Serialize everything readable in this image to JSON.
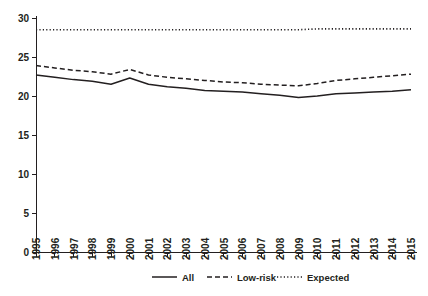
{
  "chart_data": {
    "type": "line",
    "title": "",
    "subtitle": "",
    "xlabel": "",
    "ylabel": "",
    "xlim": [
      1995,
      2015
    ],
    "ylim": [
      0,
      30
    ],
    "yticks": [
      0,
      5,
      10,
      15,
      20,
      25,
      30
    ],
    "grid": false,
    "legend_position": "bottom-center",
    "categories": [
      "1995",
      "1996",
      "1997",
      "1998",
      "1999",
      "2000",
      "2001",
      "2002",
      "2003",
      "2004",
      "2005",
      "2006",
      "2007",
      "2008",
      "2009",
      "2010",
      "2011",
      "2012",
      "2013",
      "2014",
      "2015"
    ],
    "series": [
      {
        "name": "All",
        "style": "solid",
        "color": "#231f20",
        "values": [
          22.7,
          22.4,
          22.1,
          21.9,
          21.5,
          22.3,
          21.5,
          21.2,
          21.0,
          20.7,
          20.6,
          20.5,
          20.3,
          20.1,
          19.8,
          20.0,
          20.3,
          20.4,
          20.5,
          20.6,
          20.8
        ]
      },
      {
        "name": "Low-risk",
        "style": "dashed",
        "color": "#231f20",
        "values": [
          23.9,
          23.6,
          23.3,
          23.1,
          22.8,
          23.4,
          22.7,
          22.4,
          22.2,
          22.0,
          21.8,
          21.7,
          21.5,
          21.4,
          21.3,
          21.6,
          22.0,
          22.2,
          22.4,
          22.6,
          22.8
        ]
      },
      {
        "name": "Expected",
        "style": "dotted",
        "color": "#231f20",
        "values": [
          28.5,
          28.5,
          28.5,
          28.5,
          28.5,
          28.5,
          28.5,
          28.5,
          28.5,
          28.5,
          28.5,
          28.5,
          28.5,
          28.5,
          28.5,
          28.6,
          28.6,
          28.6,
          28.6,
          28.6,
          28.6
        ]
      }
    ],
    "legend": [
      {
        "label": "All",
        "style": "solid"
      },
      {
        "label": "Low-risk",
        "style": "dashed"
      },
      {
        "label": "Expected",
        "style": "dotted"
      }
    ]
  },
  "axis": {
    "y_tick_labels": [
      "30",
      "25",
      "20",
      "15",
      "10",
      "5",
      "0"
    ],
    "x_tick_labels": [
      "1995",
      "1996",
      "1997",
      "1998",
      "1999",
      "2000",
      "2001",
      "2002",
      "2003",
      "2004",
      "2005",
      "2006",
      "2007",
      "2008",
      "2009",
      "2010",
      "2011",
      "2012",
      "2013",
      "2014",
      "2015"
    ]
  }
}
